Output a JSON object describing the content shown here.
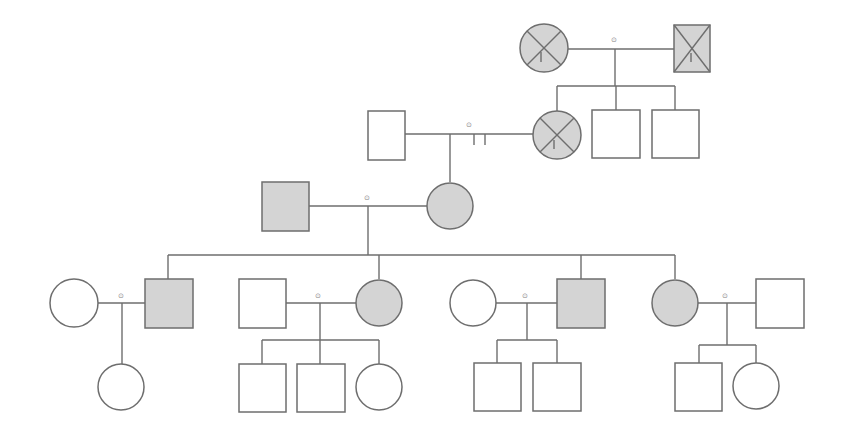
{
  "diagram": {
    "type": "pedigree-chart",
    "colors": {
      "line": "#6e6e6e",
      "affected_fill": "#d4d4d4",
      "unaffected_fill": "#ffffff",
      "background": "#ffffff"
    },
    "marriage_glyph": "⊙",
    "generations": [
      {
        "id": "I",
        "individuals": [
          {
            "id": "I-1",
            "sex": "female",
            "affected": true,
            "deceased": true,
            "proband_marker": true
          },
          {
            "id": "I-2",
            "sex": "male",
            "affected": true,
            "deceased": true,
            "proband_marker": true
          }
        ]
      },
      {
        "id": "II",
        "individuals": [
          {
            "id": "II-1",
            "sex": "male",
            "affected": false,
            "deceased": false
          },
          {
            "id": "II-2",
            "sex": "female",
            "affected": true,
            "deceased": true,
            "proband_marker": true,
            "partnership_separated": true
          },
          {
            "id": "II-3",
            "sex": "male",
            "affected": false,
            "deceased": false
          },
          {
            "id": "II-4",
            "sex": "male",
            "affected": false,
            "deceased": false
          }
        ]
      },
      {
        "id": "III",
        "individuals": [
          {
            "id": "III-1",
            "sex": "male",
            "affected": true,
            "deceased": false
          },
          {
            "id": "III-2",
            "sex": "female",
            "affected": true,
            "deceased": false
          }
        ]
      },
      {
        "id": "IV",
        "individuals": [
          {
            "id": "IV-1",
            "sex": "female",
            "affected": false
          },
          {
            "id": "IV-2",
            "sex": "male",
            "affected": true
          },
          {
            "id": "IV-3",
            "sex": "male",
            "affected": false
          },
          {
            "id": "IV-4",
            "sex": "female",
            "affected": true
          },
          {
            "id": "IV-5",
            "sex": "female",
            "affected": false
          },
          {
            "id": "IV-6",
            "sex": "male",
            "affected": true
          },
          {
            "id": "IV-7",
            "sex": "female",
            "affected": true
          },
          {
            "id": "IV-8",
            "sex": "male",
            "affected": false
          }
        ]
      },
      {
        "id": "V",
        "individuals": [
          {
            "id": "V-1",
            "sex": "female",
            "affected": false
          },
          {
            "id": "V-2",
            "sex": "male",
            "affected": false
          },
          {
            "id": "V-3",
            "sex": "male",
            "affected": false
          },
          {
            "id": "V-4",
            "sex": "female",
            "affected": false
          },
          {
            "id": "V-5",
            "sex": "male",
            "affected": false
          },
          {
            "id": "V-6",
            "sex": "male",
            "affected": false
          },
          {
            "id": "V-7",
            "sex": "male",
            "affected": false
          },
          {
            "id": "V-8",
            "sex": "female",
            "affected": false
          }
        ]
      }
    ]
  }
}
